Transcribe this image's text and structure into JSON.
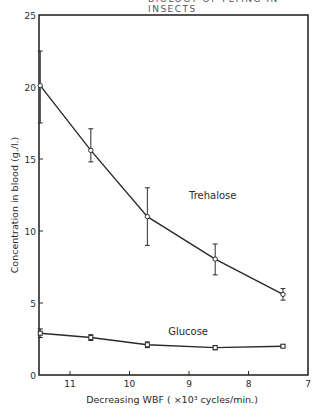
{
  "header": {
    "text": "BIOLOGY OF FLYING IN INSECTS"
  },
  "chart_data": {
    "type": "line",
    "title": "",
    "xlabel": "Decreasing WBF ( ×10³ cycles/min.)",
    "ylabel": "Concentration in blood (g./l.)",
    "xlim": [
      11.55,
      7
    ],
    "ylim": [
      0,
      25
    ],
    "x_ticks": [
      11,
      10,
      9,
      8,
      7
    ],
    "y_ticks": [
      0,
      5,
      10,
      15,
      20,
      25
    ],
    "grid": false,
    "legend": "inline labels",
    "series": [
      {
        "name": "Trehalose",
        "label_position": {
          "x": 9.0,
          "y": 12.2
        },
        "x": [
          11.5,
          10.65,
          9.7,
          8.56,
          7.42
        ],
        "y": [
          20.1,
          15.6,
          11.0,
          8.05,
          5.6
        ],
        "err_low": [
          17.5,
          14.8,
          9.0,
          6.95,
          5.2
        ],
        "err_high": [
          22.5,
          17.1,
          13.0,
          9.1,
          6.0
        ],
        "marker": "open circle"
      },
      {
        "name": "Glucose",
        "label_position": {
          "x": 9.35,
          "y": 2.8
        },
        "x": [
          11.5,
          10.65,
          9.7,
          8.56,
          7.42
        ],
        "y": [
          2.9,
          2.6,
          2.1,
          1.9,
          2.0
        ],
        "err_low": [
          2.6,
          2.4,
          1.9,
          1.75,
          1.9
        ],
        "err_high": [
          3.2,
          2.8,
          2.3,
          2.05,
          2.1
        ],
        "marker": "open square"
      }
    ]
  }
}
